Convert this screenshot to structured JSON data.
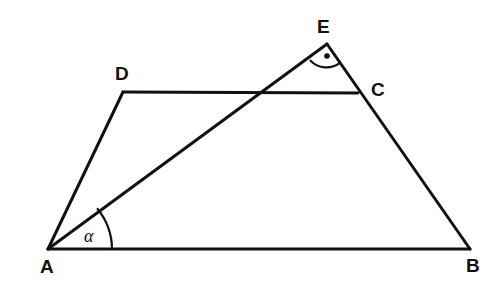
{
  "figure": {
    "type": "geometry-diagram",
    "background_color": "#ffffff",
    "stroke_color": "#111111",
    "stroke_width": 3
  },
  "points": {
    "A": {
      "label": "A",
      "x": 48,
      "y": 249,
      "label_x": 40,
      "label_y": 258
    },
    "B": {
      "label": "B",
      "x": 470,
      "y": 249,
      "label_x": 466,
      "label_y": 257
    },
    "C": {
      "label": "C",
      "x": 358,
      "y": 93,
      "label_x": 371,
      "label_y": 81
    },
    "D": {
      "label": "D",
      "x": 123,
      "y": 92,
      "label_x": 116,
      "label_y": 64
    },
    "E": {
      "label": "E",
      "x": 327,
      "y": 44,
      "label_x": 317,
      "label_y": 18
    }
  },
  "segments": [
    {
      "name": "AB",
      "from": "A",
      "to": "B"
    },
    {
      "name": "AD",
      "from": "A",
      "to": "D"
    },
    {
      "name": "DC",
      "from": "D",
      "to": "C"
    },
    {
      "name": "EB",
      "from": "E",
      "to": "B"
    },
    {
      "name": "AE",
      "from": "A",
      "to": "E"
    }
  ],
  "angles": {
    "alpha": {
      "label": "α",
      "at_point": "A",
      "between": [
        "AB",
        "AE"
      ],
      "radius": 64,
      "label_x": 84,
      "label_y": 227
    },
    "right_angle_E": {
      "label": "",
      "at_point": "E",
      "between": [
        "EA",
        "EB"
      ],
      "marker": "arc-with-dot",
      "radius": 22
    }
  },
  "geometry_paths": {
    "outline": "M 48 249 L 470 249 M 48 249 L 123 92 M 123 92 L 358 93 M 327 44 L 470 249 M 48 249 L 327 44",
    "alpha_arc": "M 112 249 A 64 64 0 0 0 97.8 209.2",
    "right_angle_arc": "M 311.3 59.6 A 22 22 0 0 0 339.5 62.6",
    "right_angle_dot": {
      "cx": 327,
      "cy": 55,
      "r": 2.6
    }
  }
}
